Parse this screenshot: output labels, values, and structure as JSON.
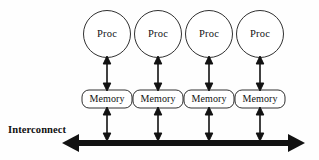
{
  "diagram": {
    "background_color": "#fefefe",
    "stroke_color": "#1a1a1a",
    "bus_color": "#121212",
    "canvas": {
      "width": 319,
      "height": 160
    },
    "bus": {
      "label": "Interconnect",
      "label_x": 8,
      "label_y": 124,
      "y": 143,
      "thickness": 6,
      "x_start": 62,
      "x_end": 305,
      "arrow_both_ends": true
    },
    "columns": [
      {
        "id": "column-1",
        "center_x": 107,
        "processor": {
          "label": "Proc",
          "cx": 107,
          "cy": 34,
          "r": 23.5
        },
        "memory": {
          "label": "Memory",
          "x": 82,
          "y": 90,
          "width": 50,
          "height": 18,
          "radius": 7
        },
        "link_proc_memory": {
          "x": 107,
          "y_top": 57,
          "y_bottom": 90,
          "double_headed": true
        },
        "link_memory_bus": {
          "x": 107,
          "y_top": 108,
          "y_bottom": 141,
          "double_headed": true
        }
      },
      {
        "id": "column-2",
        "center_x": 158,
        "processor": {
          "label": "Proc",
          "cx": 158,
          "cy": 34,
          "r": 23.5
        },
        "memory": {
          "label": "Memory",
          "x": 133,
          "y": 90,
          "width": 50,
          "height": 18,
          "radius": 7
        },
        "link_proc_memory": {
          "x": 158,
          "y_top": 57,
          "y_bottom": 90,
          "double_headed": true
        },
        "link_memory_bus": {
          "x": 158,
          "y_top": 108,
          "y_bottom": 141,
          "double_headed": true
        }
      },
      {
        "id": "column-3",
        "center_x": 209,
        "processor": {
          "label": "Proc",
          "cx": 209,
          "cy": 34,
          "r": 23.5
        },
        "memory": {
          "label": "Memory",
          "x": 184,
          "y": 90,
          "width": 50,
          "height": 18,
          "radius": 7
        },
        "link_proc_memory": {
          "x": 209,
          "y_top": 57,
          "y_bottom": 90,
          "double_headed": true
        },
        "link_memory_bus": {
          "x": 209,
          "y_top": 108,
          "y_bottom": 141,
          "double_headed": true
        }
      },
      {
        "id": "column-4",
        "center_x": 260,
        "processor": {
          "label": "Proc",
          "cx": 260,
          "cy": 34,
          "r": 23.5
        },
        "memory": {
          "label": "Memory",
          "x": 235,
          "y": 90,
          "width": 50,
          "height": 18,
          "radius": 7
        },
        "link_proc_memory": {
          "x": 260,
          "y_top": 57,
          "y_bottom": 90,
          "double_headed": true
        },
        "link_memory_bus": {
          "x": 260,
          "y_top": 108,
          "y_bottom": 141,
          "double_headed": true
        }
      }
    ]
  }
}
